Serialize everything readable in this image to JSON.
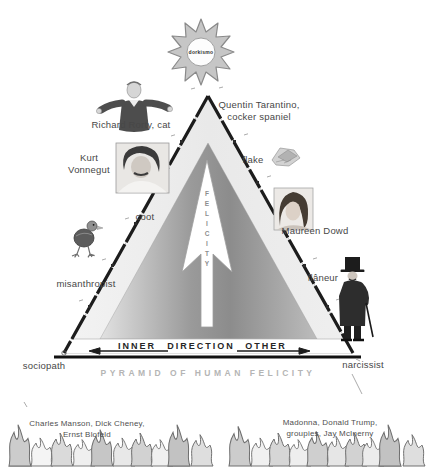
{
  "sun": {
    "label": "dorkismo"
  },
  "pyramid": {
    "axis_word": "FELICITY",
    "band": {
      "left": "INNER",
      "center": "DIRECTION",
      "right": "OTHER"
    },
    "caption": "PYRAMID OF HUMAN FELICITY"
  },
  "labels": {
    "top_right": "Quentin Tarantino,\ncocker spaniel",
    "left_top": "Richard Rorty, cat",
    "left_upper": "Kurt\nVonnegut",
    "left_middle": "coot",
    "left_lower": "misanthropist",
    "left_bottom": "sociopath",
    "right_upper": "flake",
    "right_middle": "Maureen Dowd",
    "right_lower": "flâneur",
    "right_bottom": "narcissist"
  },
  "flames": {
    "left_caption": "Charles Manson, Dick Cheney,\nErnst Blofeld",
    "right_caption": "Madonna, Donald Trump,\ngroupies, Jay McInerny"
  },
  "colors": {
    "ink": "#474747",
    "caption_muted": "#b5b5b5",
    "pyramid_outer": "#ededed",
    "pyramid_inner_dark": "#8f8f8f",
    "sun_fill": "#c6c6c6",
    "flame_gray": "#6e6e6e"
  }
}
